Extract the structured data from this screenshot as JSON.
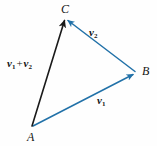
{
  "figure": {
    "kind": "vector-addition-triangle-diagram",
    "width": 157,
    "height": 146,
    "background_color": "#fefefe",
    "colors": {
      "vector_blue": "#2171a8",
      "resultant_black": "#1a1a1a",
      "label_text": "#141414"
    },
    "points": [
      {
        "id": "A",
        "label": "A",
        "x": 33,
        "y": 127
      },
      {
        "id": "B",
        "label": "B",
        "x": 136,
        "y": 73
      },
      {
        "id": "C",
        "label": "C",
        "x": 65,
        "y": 19
      }
    ],
    "vectors": [
      {
        "id": "v1",
        "from": "A",
        "to": "B",
        "color": "#2171a8",
        "label_parts": {
          "symbol": "v",
          "subscript": "1"
        },
        "label_text": "v1"
      },
      {
        "id": "v2",
        "from": "B",
        "to": "C",
        "color": "#2171a8",
        "label_parts": {
          "symbol": "v",
          "subscript": "2"
        },
        "label_text": "v2"
      },
      {
        "id": "v1_plus_v2",
        "from": "A",
        "to": "C",
        "color": "#1a1a1a",
        "label_parts": {
          "symbol1": "v",
          "subscript1": "1",
          "operator": "+",
          "symbol2": "v",
          "subscript2": "2"
        },
        "label_text": "v1 + v2"
      }
    ]
  }
}
